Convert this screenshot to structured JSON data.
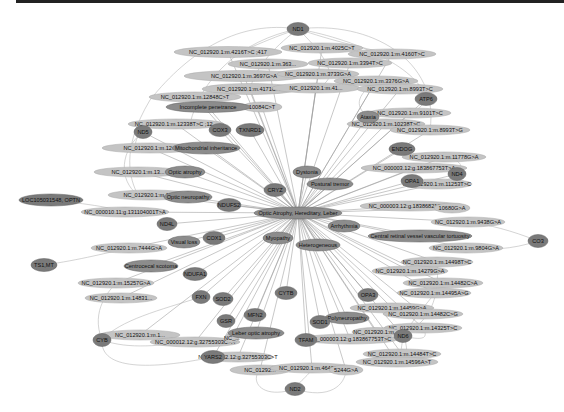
{
  "diagram": {
    "type": "network",
    "hub": "Optic Atrophy, Hereditary, Leber",
    "colors": {
      "gene_node": "#7a7a7a",
      "phenotype_node": "#8c8c8c",
      "variant_node": "#c4c4c4",
      "edge": "#9a9a9a",
      "background": "#ffffff"
    },
    "nodes": [
      {
        "id": "ND1",
        "label": "ND1",
        "kind": "gene",
        "x": 298,
        "y": 29,
        "w": 22,
        "h": 13
      },
      {
        "id": "v4216",
        "label": "NC_012920.1:m.4216T>C ;417",
        "kind": "variant",
        "x": 228,
        "y": 52,
        "w": 108,
        "h": 11
      },
      {
        "id": "v4025",
        "label": "NC_012920.1:m.4025C>T",
        "kind": "variant",
        "x": 322,
        "y": 48,
        "w": 82,
        "h": 10
      },
      {
        "id": "v4160",
        "label": "NC_012920.1:m.4160T>C",
        "kind": "variant",
        "x": 392,
        "y": 54,
        "w": 88,
        "h": 10
      },
      {
        "id": "v3635",
        "label": "NC_012920.1:m.363...",
        "kind": "variant",
        "x": 268,
        "y": 64,
        "w": 80,
        "h": 10
      },
      {
        "id": "v3394",
        "label": "NC_012920.1:m.3394T>C",
        "kind": "variant",
        "x": 350,
        "y": 63,
        "w": 84,
        "h": 10
      },
      {
        "id": "v3697",
        "label": "NC_012920.1:m.3697G>A",
        "kind": "variant",
        "x": 244,
        "y": 76,
        "w": 120,
        "h": 11
      },
      {
        "id": "v3733",
        "label": "NC_012920.1:m.3733G>A",
        "kind": "variant",
        "x": 318,
        "y": 74,
        "w": 82,
        "h": 10
      },
      {
        "id": "v3376",
        "label": "NC_012920.1:m.3376G>A",
        "kind": "variant",
        "x": 376,
        "y": 81,
        "w": 84,
        "h": 10
      },
      {
        "id": "v4171",
        "label": "NC_012920.1:m.4171C>A",
        "kind": "variant",
        "x": 250,
        "y": 89,
        "w": 96,
        "h": 11
      },
      {
        "id": "v4136",
        "label": "NC_012920.1:m.41...",
        "kind": "variant",
        "x": 316,
        "y": 88,
        "w": 88,
        "h": 10
      },
      {
        "id": "v8993",
        "label": "NC_012920.1:m.8993T>C",
        "kind": "variant",
        "x": 400,
        "y": 89,
        "w": 86,
        "h": 10
      },
      {
        "id": "v12848",
        "label": "NC_012920.1:m.12848C>T",
        "kind": "variant",
        "x": 195,
        "y": 97,
        "w": 92,
        "h": 10
      },
      {
        "id": "incomplete",
        "label": "Incomplete penetrance",
        "kind": "phenotype",
        "x": 208,
        "y": 107,
        "w": 84,
        "h": 11
      },
      {
        "id": "v10084",
        "label": "10084C>T",
        "kind": "variant",
        "x": 262,
        "y": 107,
        "w": 40,
        "h": 10
      },
      {
        "id": "ATP6",
        "label": "ATP6",
        "kind": "gene",
        "x": 426,
        "y": 99,
        "w": 22,
        "h": 13
      },
      {
        "id": "v12338",
        "label": "NC_012920.1:m.12338T>C ;12...",
        "kind": "variant",
        "x": 176,
        "y": 124,
        "w": 96,
        "h": 10
      },
      {
        "id": "ND5",
        "label": "ND5",
        "kind": "gene",
        "x": 143,
        "y": 132,
        "w": 18,
        "h": 13
      },
      {
        "id": "COX3",
        "label": "COX3",
        "kind": "gene",
        "x": 220,
        "y": 130,
        "w": 22,
        "h": 13
      },
      {
        "id": "TXNRD1",
        "label": "TXNRD1",
        "kind": "gene",
        "x": 250,
        "y": 130,
        "w": 28,
        "h": 13
      },
      {
        "id": "v9101",
        "label": "NC_012920.1:m.9101T>C",
        "kind": "variant",
        "x": 410,
        "y": 113,
        "w": 82,
        "h": 10
      },
      {
        "id": "Ataxia",
        "label": "Ataxia",
        "kind": "phenotype",
        "x": 368,
        "y": 117,
        "w": 22,
        "h": 12
      },
      {
        "id": "v10238",
        "label": "NC_012920.1:m.10238T>C",
        "kind": "variant",
        "x": 386,
        "y": 124,
        "w": 78,
        "h": 10
      },
      {
        "id": "v8993a",
        "label": "NC_012920.1:m.8993T>G",
        "kind": "variant",
        "x": 430,
        "y": 130,
        "w": 80,
        "h": 10
      },
      {
        "id": "v13xx1",
        "label": "NC_012920.1:m.12...",
        "kind": "variant",
        "x": 150,
        "y": 148,
        "w": 96,
        "h": 10
      },
      {
        "id": "mito",
        "label": "Mitochondrial inheritance",
        "kind": "phenotype",
        "x": 206,
        "y": 148,
        "w": 68,
        "h": 12
      },
      {
        "id": "ENDOG",
        "label": "ENDOG",
        "kind": "gene",
        "x": 402,
        "y": 149,
        "w": 26,
        "h": 13
      },
      {
        "id": "v11778",
        "label": "NC_012920.1:m.11778G>A",
        "kind": "variant",
        "x": 444,
        "y": 157,
        "w": 84,
        "h": 10
      },
      {
        "id": "v13xx2",
        "label": "NC_012920.1:m.13...",
        "kind": "variant",
        "x": 138,
        "y": 172,
        "w": 88,
        "h": 10
      },
      {
        "id": "opticatrophy",
        "label": "Optic atrophy",
        "kind": "phenotype",
        "x": 185,
        "y": 172,
        "w": 40,
        "h": 12
      },
      {
        "id": "Dystonia",
        "label": "Dystonia",
        "kind": "phenotype",
        "x": 307,
        "y": 172,
        "w": 28,
        "h": 12
      },
      {
        "id": "v183867",
        "label": "NC_000003.12:g.183867753T>A",
        "kind": "variant",
        "x": 414,
        "y": 168,
        "w": 106,
        "h": 10
      },
      {
        "id": "ND4",
        "label": "ND4",
        "kind": "gene",
        "x": 457,
        "y": 174,
        "w": 18,
        "h": 13
      },
      {
        "id": "posturaltremor",
        "label": "Postural tremor",
        "kind": "phenotype",
        "x": 330,
        "y": 184,
        "w": 46,
        "h": 12
      },
      {
        "id": "OPA1",
        "label": "OPA1",
        "kind": "gene",
        "x": 412,
        "y": 181,
        "w": 22,
        "h": 13
      },
      {
        "id": "v11253",
        "label": "NC_012920.1:m.11253T>C",
        "kind": "variant",
        "x": 437,
        "y": 184,
        "w": 70,
        "h": 10
      },
      {
        "id": "CRYZ",
        "label": "CRYZ",
        "kind": "gene",
        "x": 275,
        "y": 190,
        "w": 22,
        "h": 13
      },
      {
        "id": "LOC",
        "label": "LOC105031548, OPTN",
        "kind": "gene",
        "x": 51,
        "y": 200,
        "w": 64,
        "h": 12
      },
      {
        "id": "v13xx3",
        "label": "NC_012920.1:m.13...",
        "kind": "variant",
        "x": 150,
        "y": 195,
        "w": 84,
        "h": 10
      },
      {
        "id": "opticneuropathy",
        "label": "Optic neuropathy",
        "kind": "phenotype",
        "x": 188,
        "y": 197,
        "w": 48,
        "h": 12
      },
      {
        "id": "v183868",
        "label": "NC_000003.12:g.183868217C>T",
        "kind": "variant",
        "x": 410,
        "y": 206,
        "w": 100,
        "h": 10
      },
      {
        "id": "v10680",
        "label": "10680G>A",
        "kind": "variant",
        "x": 452,
        "y": 208,
        "w": 36,
        "h": 10
      },
      {
        "id": "NDUFS2",
        "label": "NDUFS2",
        "kind": "gene",
        "x": 229,
        "y": 205,
        "w": 24,
        "h": 13
      },
      {
        "id": "v131104",
        "label": "NC_000010.11:g.131104001T>A",
        "kind": "variant",
        "x": 125,
        "y": 212,
        "w": 88,
        "h": 10
      },
      {
        "id": "hub",
        "label": "Optic Atrophy, Hereditary, Leber",
        "kind": "phenotype",
        "x": 298,
        "y": 213,
        "w": 88,
        "h": 12
      },
      {
        "id": "v9438",
        "label": "NC_012920.1:m.9438G>A",
        "kind": "variant",
        "x": 468,
        "y": 222,
        "w": 74,
        "h": 10
      },
      {
        "id": "ND4L",
        "label": "ND4L",
        "kind": "gene",
        "x": 167,
        "y": 224,
        "w": 20,
        "h": 13
      },
      {
        "id": "Arrhythmia",
        "label": "Arrhythmia",
        "kind": "phenotype",
        "x": 344,
        "y": 226,
        "w": 32,
        "h": 12
      },
      {
        "id": "crvvt",
        "label": "Central retinal vessel vascular tortuosity",
        "kind": "phenotype",
        "x": 420,
        "y": 236,
        "w": 104,
        "h": 12
      },
      {
        "id": "CO3",
        "label": "CO3",
        "kind": "gene",
        "x": 538,
        "y": 241,
        "w": 20,
        "h": 13
      },
      {
        "id": "COX1",
        "label": "COX1",
        "kind": "gene",
        "x": 214,
        "y": 238,
        "w": 22,
        "h": 13
      },
      {
        "id": "Myopathy",
        "label": "Myopathy",
        "kind": "phenotype",
        "x": 278,
        "y": 238,
        "w": 30,
        "h": 12
      },
      {
        "id": "Heterogeneous",
        "label": "Heterogeneous",
        "kind": "phenotype",
        "x": 318,
        "y": 245,
        "w": 44,
        "h": 12
      },
      {
        "id": "visualloss",
        "label": "Visual loss",
        "kind": "phenotype",
        "x": 184,
        "y": 242,
        "w": 32,
        "h": 12
      },
      {
        "id": "v7444",
        "label": "NC_012920.1:m.7444G>A",
        "kind": "variant",
        "x": 129,
        "y": 248,
        "w": 76,
        "h": 10
      },
      {
        "id": "v9804",
        "label": "NC_012920.1:m.9804G>A",
        "kind": "variant",
        "x": 466,
        "y": 248,
        "w": 74,
        "h": 10
      },
      {
        "id": "TS1MT",
        "label": "TS1,MT",
        "kind": "gene",
        "x": 44,
        "y": 265,
        "w": 26,
        "h": 13
      },
      {
        "id": "centrocecal",
        "label": "Centrocecal scotoma",
        "kind": "phenotype",
        "x": 151,
        "y": 266,
        "w": 54,
        "h": 12
      },
      {
        "id": "v14498",
        "label": "NC_012920.1:m.14498T>C",
        "kind": "variant",
        "x": 437,
        "y": 262,
        "w": 72,
        "h": 10
      },
      {
        "id": "NDUFA1",
        "label": "NDUFA1",
        "kind": "gene",
        "x": 195,
        "y": 274,
        "w": 24,
        "h": 13
      },
      {
        "id": "v14279",
        "label": "NC_012920.1:m.14279G>A",
        "kind": "variant",
        "x": 410,
        "y": 271,
        "w": 76,
        "h": 10
      },
      {
        "id": "v15257",
        "label": "NC_012920.1:m.15257G>A",
        "kind": "variant",
        "x": 116,
        "y": 283,
        "w": 76,
        "h": 10
      },
      {
        "id": "v14482a",
        "label": "NC_012920.1:m.14482C>A",
        "kind": "variant",
        "x": 443,
        "y": 283,
        "w": 80,
        "h": 10
      },
      {
        "id": "CYTB",
        "label": "CYTB",
        "kind": "gene",
        "x": 286,
        "y": 293,
        "w": 22,
        "h": 13
      },
      {
        "id": "v14495",
        "label": "NC_012920.1:m.14495A>G",
        "kind": "variant",
        "x": 434,
        "y": 293,
        "w": 74,
        "h": 10
      },
      {
        "id": "v14831",
        "label": "NC_012920.1:m.14831...",
        "kind": "variant",
        "x": 121,
        "y": 298,
        "w": 72,
        "h": 10
      },
      {
        "id": "FXN",
        "label": "FXN",
        "kind": "gene",
        "x": 201,
        "y": 297,
        "w": 18,
        "h": 13
      },
      {
        "id": "SOD2",
        "label": "SOD2",
        "kind": "gene",
        "x": 223,
        "y": 299,
        "w": 20,
        "h": 13
      },
      {
        "id": "OPA3",
        "label": "OPA3",
        "kind": "gene",
        "x": 368,
        "y": 295,
        "w": 20,
        "h": 13
      },
      {
        "id": "v14459",
        "label": "NC_012920.1:m.14459G>A",
        "kind": "variant",
        "x": 392,
        "y": 308,
        "w": 84,
        "h": 10
      },
      {
        "id": "v14482b",
        "label": "NC_012920.1:m.14482C>G",
        "kind": "variant",
        "x": 423,
        "y": 314,
        "w": 80,
        "h": 10
      },
      {
        "id": "MFN2",
        "label": "MFN2",
        "kind": "gene",
        "x": 255,
        "y": 315,
        "w": 22,
        "h": 13
      },
      {
        "id": "GSR",
        "label": "GSR",
        "kind": "gene",
        "x": 226,
        "y": 321,
        "w": 18,
        "h": 13
      },
      {
        "id": "SOD1",
        "label": "SOD1",
        "kind": "gene",
        "x": 320,
        "y": 322,
        "w": 20,
        "h": 13
      },
      {
        "id": "Polyneuropathy",
        "label": "Polyneuropathy",
        "kind": "phenotype",
        "x": 347,
        "y": 318,
        "w": 44,
        "h": 12
      },
      {
        "id": "v14325",
        "label": "NC_012920.1:m.14325T>C",
        "kind": "variant",
        "x": 423,
        "y": 328,
        "w": 78,
        "h": 10
      },
      {
        "id": "v1xxx",
        "label": "NC_012920.1:m.1...",
        "kind": "variant",
        "x": 140,
        "y": 335,
        "w": 80,
        "h": 10
      },
      {
        "id": "v32755a",
        "label": "NC_000012.12:g.32755303C>A",
        "kind": "variant",
        "x": 195,
        "y": 342,
        "w": 90,
        "h": 10
      },
      {
        "id": "lebercopticatrophy",
        "label": "Leber optic atrophy",
        "kind": "phenotype",
        "x": 256,
        "y": 333,
        "w": 56,
        "h": 12
      },
      {
        "id": "ND6",
        "label": "ND6",
        "kind": "gene",
        "x": 403,
        "y": 336,
        "w": 18,
        "h": 13
      },
      {
        "id": "v1838x",
        "label": "NC_000003.12:g.183867753T>C",
        "kind": "variant",
        "x": 350,
        "y": 339,
        "w": 96,
        "h": 10
      },
      {
        "id": "v_mid",
        "label": "NC_012920.1:m...",
        "kind": "variant",
        "x": 376,
        "y": 332,
        "w": 48,
        "h": 9
      },
      {
        "id": "TFAM",
        "label": "TFAM",
        "kind": "gene",
        "x": 306,
        "y": 340,
        "w": 22,
        "h": 13
      },
      {
        "id": "v_left2",
        "label": "NC_...",
        "kind": "variant",
        "x": 232,
        "y": 338,
        "w": 14,
        "h": 10
      },
      {
        "id": "CYB",
        "label": "CYB",
        "kind": "gene",
        "x": 102,
        "y": 340,
        "w": 18,
        "h": 13
      },
      {
        "id": "YARS2",
        "label": "YARS2",
        "kind": "gene",
        "x": 213,
        "y": 357,
        "w": 24,
        "h": 13
      },
      {
        "id": "v32755t",
        "label": "NC_000012.12:g.32755303C>T",
        "kind": "variant",
        "x": 238,
        "y": 357,
        "w": 70,
        "h": 10
      },
      {
        "id": "v14484",
        "label": "NC_012920.1:m.14484T>C",
        "kind": "variant",
        "x": 402,
        "y": 354,
        "w": 78,
        "h": 10
      },
      {
        "id": "v14596",
        "label": "NC_012920.1:m.14596A>T",
        "kind": "variant",
        "x": 397,
        "y": 362,
        "w": 82,
        "h": 10
      },
      {
        "id": "v_bot1",
        "label": "NC_01292...",
        "kind": "variant",
        "x": 260,
        "y": 370,
        "w": 60,
        "h": 10
      },
      {
        "id": "v4640",
        "label": "NC_012920.1:m.4640C>A",
        "kind": "variant",
        "x": 312,
        "y": 368,
        "w": 84,
        "h": 10
      },
      {
        "id": "v5244",
        "label": "5244G>A",
        "kind": "variant",
        "x": 346,
        "y": 370,
        "w": 34,
        "h": 10
      },
      {
        "id": "ND2",
        "label": "ND2",
        "kind": "gene",
        "x": 295,
        "y": 389,
        "w": 20,
        "h": 13
      }
    ]
  }
}
